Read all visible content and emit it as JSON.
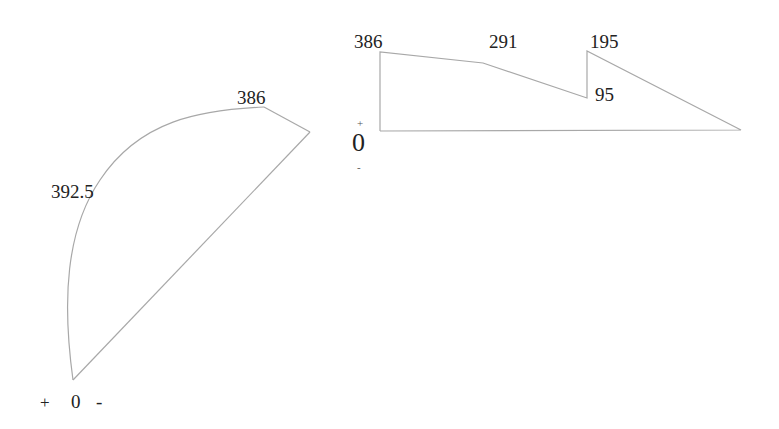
{
  "style": {
    "line_color": "#a8a8a8",
    "text_color": "#222222",
    "background": "#ffffff"
  },
  "left_diagram": {
    "peak_label": "386",
    "mid_label": "392.5",
    "axis": {
      "plus": "+",
      "zero": "0",
      "minus": "-"
    }
  },
  "right_diagram": {
    "labels": {
      "start": "386",
      "kink": "291",
      "jump_top": "195",
      "jump_bottom": "95"
    },
    "axis": {
      "plus": "+",
      "zero": "0",
      "minus": "-"
    }
  }
}
